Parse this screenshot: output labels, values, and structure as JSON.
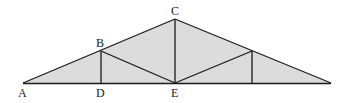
{
  "diagram": {
    "type": "roof-truss",
    "fill_color": "#dcdcdc",
    "line_color": "#1a1a1a",
    "points": {
      "A": {
        "label": "A",
        "x": 23,
        "y": 83
      },
      "B": {
        "label": "B",
        "x": 101,
        "y": 51
      },
      "C": {
        "label": "C",
        "x": 175,
        "y": 19
      },
      "D": {
        "label": "D",
        "x": 101,
        "y": 83
      },
      "E": {
        "label": "E",
        "x": 175,
        "y": 83
      },
      "F": {
        "label": "",
        "x": 252,
        "y": 51
      },
      "G": {
        "label": "",
        "x": 252,
        "y": 83
      },
      "H": {
        "label": "",
        "x": 331,
        "y": 83
      }
    },
    "labels": {
      "A": "A",
      "B": "B",
      "C": "C",
      "D": "D",
      "E": "E"
    }
  }
}
